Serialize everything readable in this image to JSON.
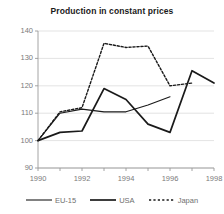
{
  "chart_data": {
    "type": "line",
    "title": "Production in constant prices",
    "xlabel": "",
    "ylabel": "",
    "xlim": [
      1990,
      1998
    ],
    "ylim": [
      90,
      140
    ],
    "yticks": [
      90,
      100,
      110,
      120,
      130,
      140
    ],
    "xticks": [
      1990,
      1992,
      1994,
      1996,
      1998
    ],
    "grid": true,
    "grid_axis": "y",
    "legend_position": "bottom",
    "x": [
      1990,
      1991,
      1992,
      1993,
      1994,
      1995,
      1996,
      1997,
      1998
    ],
    "series": [
      {
        "name": "EU-15",
        "style": "solid",
        "color": "#1a1a1a",
        "x": [
          1990,
          1991,
          1992,
          1993,
          1994,
          1995,
          1996
        ],
        "values": [
          100,
          110,
          111.5,
          110.5,
          110.5,
          113,
          116
        ]
      },
      {
        "name": "USA",
        "style": "solid",
        "color": "#1a1a1a",
        "x": [
          1990,
          1991,
          1992,
          1993,
          1994,
          1995,
          1996,
          1997,
          1998
        ],
        "values": [
          100,
          103,
          103.5,
          119,
          115,
          106,
          103,
          125.5,
          121
        ]
      },
      {
        "name": "Japan",
        "style": "dashed",
        "color": "#1a1a1a",
        "x": [
          1990,
          1991,
          1992,
          1993,
          1994,
          1995,
          1996,
          1997
        ],
        "values": [
          100,
          110.5,
          112,
          135.5,
          134,
          134.5,
          120,
          121
        ]
      }
    ]
  },
  "legend": {
    "items": [
      {
        "label": "EU-15",
        "style": "solid",
        "width": 1.1
      },
      {
        "label": "USA",
        "style": "solid",
        "width": 1.7
      },
      {
        "label": "Japan",
        "style": "dashed",
        "width": 1.4
      }
    ]
  },
  "colors": {
    "ink": "#1a1a1a",
    "axis": "#9a9a9a",
    "grid": "#dcdcdc",
    "tick_text": "#7a7a7a",
    "background": "#ffffff"
  }
}
